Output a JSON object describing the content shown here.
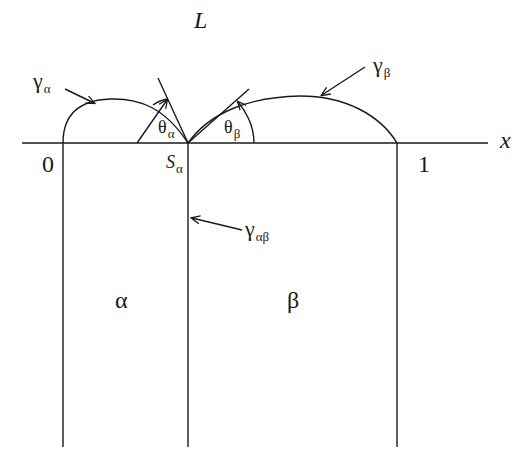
{
  "diagram": {
    "labels": {
      "liquid": "L",
      "axis_x": "x",
      "origin": "0",
      "one": "1",
      "phase_alpha": "α",
      "phase_beta": "β",
      "gamma_alpha_main": "γ",
      "gamma_alpha_sub": "α",
      "gamma_beta_main": "γ",
      "gamma_beta_sub": "β",
      "gamma_ab_main": "γ",
      "gamma_ab_sub": "αβ",
      "theta_alpha_main": "θ",
      "theta_alpha_sub": "α",
      "theta_beta_main": "θ",
      "theta_beta_sub": "β",
      "s_alpha_main": "S",
      "s_alpha_sub": "α"
    },
    "colors": {
      "line": "#1a1a1a",
      "background": "#ffffff"
    }
  }
}
